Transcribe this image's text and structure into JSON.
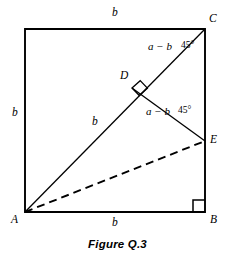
{
  "figure": {
    "caption": "Figure Q.3",
    "vertices": [
      {
        "id": "A",
        "label": "A",
        "x": 25,
        "y": 212,
        "label_x": 11,
        "label_y": 214
      },
      {
        "id": "B",
        "label": "B",
        "x": 205,
        "y": 212,
        "label_x": 210,
        "label_y": 214
      },
      {
        "id": "C",
        "label": "C",
        "x": 205,
        "y": 29,
        "label_x": 209,
        "label_y": 13
      },
      {
        "id": "T",
        "label": "",
        "x": 25,
        "y": 29,
        "label_x": 0,
        "label_y": 0
      },
      {
        "id": "D",
        "label": "D",
        "x": 132,
        "y": 88,
        "label_x": 120,
        "label_y": 70
      },
      {
        "id": "E",
        "label": "E",
        "x": 205,
        "y": 141,
        "label_x": 210,
        "label_y": 136
      }
    ],
    "side_labels": [
      {
        "name": "top-side-length",
        "text": "b",
        "x": 112,
        "y": 8
      },
      {
        "name": "left-side-length",
        "text": "b",
        "x": 12,
        "y": 108
      },
      {
        "name": "bottom-side-length",
        "text": "b",
        "x": 112,
        "y": 218
      },
      {
        "name": "diagonal-ad-length",
        "text": "b",
        "x": 92,
        "y": 117
      }
    ],
    "segment_labels": [
      {
        "name": "segment-dc-length",
        "text": "a − b",
        "x": 148,
        "y": 42
      },
      {
        "name": "segment-de-length",
        "text": "a − b",
        "x": 146,
        "y": 107
      }
    ],
    "angle_labels": [
      {
        "name": "angle-at-c",
        "text": "45°",
        "x": 181,
        "y": 42
      },
      {
        "name": "angle-at-e",
        "text": "45°",
        "x": 178,
        "y": 107
      }
    ],
    "right_angle_markers": [
      {
        "name": "right-angle-at-b",
        "x": 205,
        "y": 212
      },
      {
        "name": "right-angle-at-d",
        "x": 132,
        "y": 88
      }
    ],
    "style": {
      "stroke_color": "#000000",
      "square_stroke_width": 1.9,
      "line_stroke_width": 1.3,
      "dash_stroke_width": 1.9,
      "dash_pattern": "8,5",
      "background": "#ffffff"
    }
  }
}
